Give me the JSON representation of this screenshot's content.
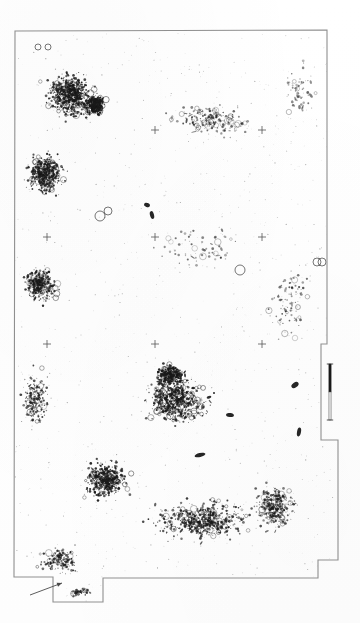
{
  "figure": {
    "type": "archaeological-site-distribution-plan",
    "orientation": "portrait",
    "background_color": "#ffffff",
    "ink_color": "#1a1a1a",
    "border_color": "#8a8a8a",
    "title": "",
    "caption": "",
    "page_width": 360,
    "page_height": 623
  },
  "boundary": {
    "name": "site-outline",
    "stroke": "#8f8f8f",
    "stroke_width": 1.1,
    "points": "15,31 327,30 327,344 321,344 321,440 338,440 338,560 318,560 318,578 103,578 103,602 53,602 53,577 14,577"
  },
  "scale_bar": {
    "name": "scale-bar",
    "x": 330,
    "y_top": 364,
    "y_bottom": 420,
    "dark_segment_color": "#1a1a1a",
    "light_segment_color": "#e6e6e6",
    "label_top": "",
    "label_bottom": "",
    "units": ""
  },
  "north_arrow": {
    "name": "north-arrow",
    "x1": 30,
    "y1": 595,
    "x2": 62,
    "y2": 583,
    "color": "#4a4a4a"
  },
  "grid_marks": {
    "name": "grid-cross-marks",
    "symbol": "+",
    "color": "#555555",
    "size": 4,
    "positions": [
      [
        155,
        130
      ],
      [
        262,
        130
      ],
      [
        47,
        237
      ],
      [
        155,
        237
      ],
      [
        262,
        237
      ],
      [
        47,
        344
      ],
      [
        155,
        344
      ],
      [
        262,
        344
      ]
    ]
  },
  "chart_data": {
    "type": "scatter",
    "title": "",
    "xlabel": "",
    "ylabel": "",
    "grid": false,
    "legend": null,
    "marker_kinds": [
      "filled-dot",
      "open-circle",
      "elongated-blob",
      "small-speck"
    ],
    "density_clusters": [
      {
        "name": "nw-dense-cluster",
        "cx": 70,
        "cy": 95,
        "rx": 52,
        "ry": 50,
        "count": 520,
        "intensity": "high"
      },
      {
        "name": "nw-upper-cluster",
        "cx": 95,
        "cy": 105,
        "rx": 26,
        "ry": 26,
        "count": 260,
        "intensity": "very-high"
      },
      {
        "name": "w-mid-cluster",
        "cx": 45,
        "cy": 175,
        "rx": 40,
        "ry": 45,
        "count": 380,
        "intensity": "high"
      },
      {
        "name": "w-lower-cluster",
        "cx": 40,
        "cy": 285,
        "rx": 36,
        "ry": 40,
        "count": 300,
        "intensity": "medium-high"
      },
      {
        "name": "n-sparse-band",
        "cx": 210,
        "cy": 120,
        "rx": 90,
        "ry": 40,
        "count": 190,
        "intensity": "low"
      },
      {
        "name": "central-void",
        "cx": 200,
        "cy": 250,
        "rx": 110,
        "ry": 60,
        "count": 70,
        "intensity": "very-low"
      },
      {
        "name": "s-central-cluster",
        "cx": 175,
        "cy": 400,
        "rx": 70,
        "ry": 55,
        "count": 520,
        "intensity": "high"
      },
      {
        "name": "s-central-core",
        "cx": 170,
        "cy": 375,
        "rx": 32,
        "ry": 26,
        "count": 230,
        "intensity": "very-high"
      },
      {
        "name": "sw-cluster",
        "cx": 105,
        "cy": 480,
        "rx": 48,
        "ry": 42,
        "count": 420,
        "intensity": "high"
      },
      {
        "name": "s-broad-band",
        "cx": 200,
        "cy": 520,
        "rx": 110,
        "ry": 45,
        "count": 480,
        "intensity": "medium-high"
      },
      {
        "name": "se-cluster",
        "cx": 275,
        "cy": 505,
        "rx": 45,
        "ry": 48,
        "count": 300,
        "intensity": "medium"
      },
      {
        "name": "e-sparse",
        "cx": 290,
        "cy": 300,
        "rx": 45,
        "ry": 90,
        "count": 90,
        "intensity": "low"
      },
      {
        "name": "sw-tail",
        "cx": 60,
        "cy": 560,
        "rx": 45,
        "ry": 30,
        "count": 160,
        "intensity": "medium"
      },
      {
        "name": "bottom-notch",
        "cx": 80,
        "cy": 592,
        "rx": 28,
        "ry": 10,
        "count": 55,
        "intensity": "medium"
      },
      {
        "name": "ne-scatter",
        "cx": 300,
        "cy": 90,
        "rx": 35,
        "ry": 60,
        "count": 60,
        "intensity": "very-low"
      },
      {
        "name": "mid-left-scatter",
        "cx": 35,
        "cy": 400,
        "rx": 30,
        "ry": 60,
        "count": 180,
        "intensity": "medium"
      }
    ],
    "notable_marks": [
      {
        "name": "dark-blob-1",
        "x": 200,
        "y": 455,
        "w": 11,
        "h": 4,
        "angle": -12
      },
      {
        "name": "dark-blob-2",
        "x": 230,
        "y": 415,
        "w": 8,
        "h": 4,
        "angle": 8
      },
      {
        "name": "dark-blob-3",
        "x": 295,
        "y": 385,
        "w": 8,
        "h": 5,
        "angle": -35
      },
      {
        "name": "dark-blob-4",
        "x": 299,
        "y": 432,
        "w": 4,
        "h": 9,
        "angle": 10
      },
      {
        "name": "dark-blob-5",
        "x": 152,
        "y": 215,
        "w": 4,
        "h": 8,
        "angle": -15
      },
      {
        "name": "dark-blob-6",
        "x": 147,
        "y": 205,
        "w": 6,
        "h": 4,
        "angle": 20
      },
      {
        "name": "open-ring-1",
        "x": 100,
        "y": 216,
        "r": 5
      },
      {
        "name": "open-ring-2",
        "x": 108,
        "y": 211,
        "r": 4
      },
      {
        "name": "open-ring-3",
        "x": 240,
        "y": 270,
        "r": 5
      },
      {
        "name": "open-ring-4",
        "x": 317,
        "y": 262,
        "r": 4
      },
      {
        "name": "open-ring-5",
        "x": 322,
        "y": 262,
        "r": 4
      },
      {
        "name": "open-ring-6",
        "x": 48,
        "y": 47,
        "r": 3
      },
      {
        "name": "open-ring-7",
        "x": 38,
        "y": 47,
        "r": 3
      }
    ],
    "total_marks_estimate": 4200
  }
}
